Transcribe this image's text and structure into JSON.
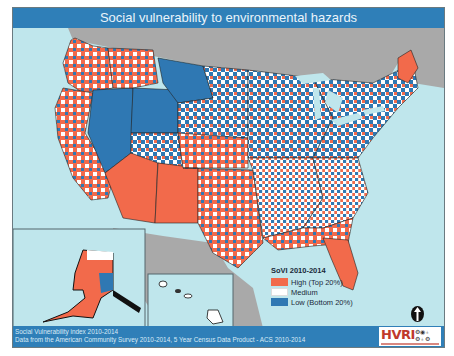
{
  "title": "Social vulnerability to environmental hazards",
  "legend": {
    "title": "SoVI 2010-2014",
    "items": [
      {
        "label": "High (Top 20%)",
        "color": "#f26a4b"
      },
      {
        "label": "Medium",
        "color": "#ffffff"
      },
      {
        "label": "Low (Bottom 20%)",
        "color": "#2f78b3"
      }
    ]
  },
  "footer": {
    "line1": "Social Vulnerability index 2010-2014",
    "line2": "Data from the American Community Survey 2010-2014, 5 Year Census Data Product - ACS 2010-2014",
    "logo_text": "HVRI",
    "logo_icons": "⚙◉♁ ⚙♁⚙"
  },
  "insets": [
    "Alaska",
    "Hawaii"
  ],
  "north_arrow": "north-arrow",
  "colors": {
    "title_bar": "#2f7fb8",
    "water": "#bfe6ec",
    "land_other": "#a9a9a9",
    "high": "#f26a4b",
    "medium": "#ffffff",
    "low": "#2f78b3"
  }
}
